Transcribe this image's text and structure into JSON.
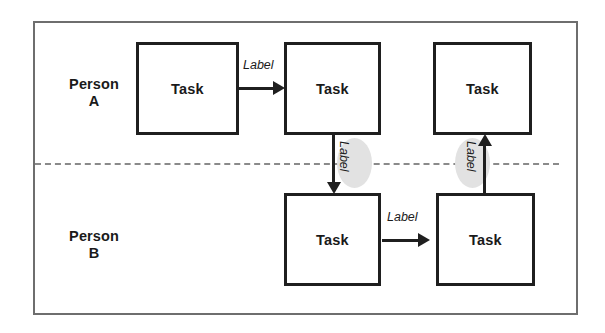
{
  "diagram": {
    "type": "swimlane-flowchart",
    "title": "",
    "frame": {
      "border_color": "#6e6e6e"
    },
    "divider": {
      "style": "dashed",
      "color": "#8a8a8a"
    },
    "lanes": [
      {
        "id": "lane-a",
        "label": "Person\nA"
      },
      {
        "id": "lane-b",
        "label": "Person\nB"
      }
    ],
    "nodes": [
      {
        "id": "task-a1",
        "label": "Task",
        "lane": "lane-a"
      },
      {
        "id": "task-a2",
        "label": "Task",
        "lane": "lane-a"
      },
      {
        "id": "task-a3",
        "label": "Task",
        "lane": "lane-a"
      },
      {
        "id": "task-b1",
        "label": "Task",
        "lane": "lane-b"
      },
      {
        "id": "task-b2",
        "label": "Task",
        "lane": "lane-b"
      }
    ],
    "edges": [
      {
        "id": "edge-a1-a2",
        "from": "task-a1",
        "to": "task-a2",
        "label": "Label",
        "direction": "right",
        "crosses_lane": false
      },
      {
        "id": "edge-a2-b1",
        "from": "task-a2",
        "to": "task-b1",
        "label": "Label",
        "direction": "down",
        "crosses_lane": true
      },
      {
        "id": "edge-b1-b2",
        "from": "task-b1",
        "to": "task-b2",
        "label": "Label",
        "direction": "right",
        "crosses_lane": false
      },
      {
        "id": "edge-b2-a3",
        "from": "task-b2",
        "to": "task-a3",
        "label": "Label",
        "direction": "up",
        "crosses_lane": true
      }
    ],
    "colors": {
      "node_border": "#1f1f1f",
      "node_fill": "#ffffff",
      "connector": "#1f1f1f",
      "lane_cross_blob": "#e2e2e2",
      "text": "#1a1a1a"
    }
  }
}
